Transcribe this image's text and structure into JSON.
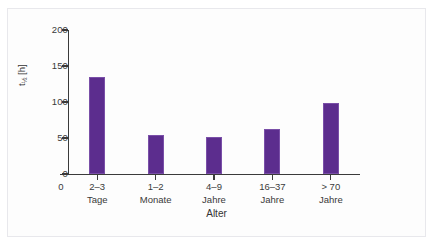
{
  "chart_data": {
    "type": "bar",
    "title": "",
    "subtitle": "",
    "xlabel": "Alter",
    "ylabel": "t1/2 [h]",
    "ylabel_base": "t",
    "ylabel_sub": "½",
    "ylabel_unit": " [h]",
    "categories": [
      "2–3 Tage",
      "1–2 Monate",
      "4–9 Jahre",
      "16–37 Jahre",
      "> 70 Jahre"
    ],
    "category_lines": [
      {
        "line1": "2–3",
        "line2": "Tage"
      },
      {
        "line1": "1–2",
        "line2": "Monate"
      },
      {
        "line1": "4–9",
        "line2": "Jahre"
      },
      {
        "line1": "16–37",
        "line2": "Jahre"
      },
      {
        "line1": "> 70",
        "line2": "Jahre"
      }
    ],
    "values": [
      135,
      54,
      51,
      62,
      98
    ],
    "ylim": [
      0,
      200
    ],
    "yticks": [
      0,
      50,
      100,
      150,
      200
    ],
    "ytick_labels": [
      "0",
      "50",
      "100",
      "150",
      "200"
    ],
    "origin_label": "0",
    "grid": false,
    "legend": null,
    "bar_color": "#5c2d8e",
    "axis_color": "#3b3b3b",
    "text_color": "#3a3a3a",
    "background": "#ffffff"
  }
}
